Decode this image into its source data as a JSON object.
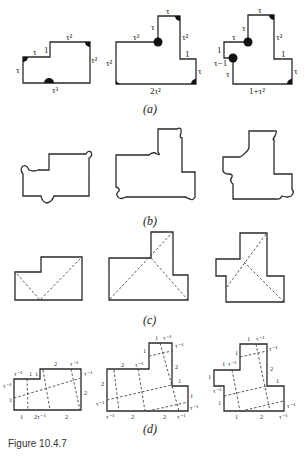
{
  "caption": "Figure 10.4.7",
  "panels": {
    "a": {
      "label": "(a)",
      "shapes": [
        {
          "edges": [
            "τ",
            "τ",
            "1",
            "τ²",
            "τ²",
            "τ³"
          ]
        },
        {
          "edges": [
            "τ²",
            "τ²",
            "τ",
            "τ",
            "τ²",
            "1",
            "τ",
            "2τ²"
          ]
        },
        {
          "edges": [
            "1",
            "τ",
            "τ",
            "τ",
            "τ²",
            "1",
            "τ",
            "1+τ²",
            "τ",
            "τ−1"
          ]
        }
      ]
    },
    "b": {
      "label": "(b)"
    },
    "c": {
      "label": "(c)"
    },
    "d": {
      "label": "(d)",
      "shapes": [
        {
          "labels": [
            "2",
            "τ⁻¹",
            "τ⁻¹",
            "τ⁻¹",
            "1",
            "1",
            "τ⁻¹",
            "1",
            "2",
            "1",
            "2τ⁻¹",
            "2"
          ]
        },
        {
          "labels": [
            "1",
            "τ⁻¹",
            "τ⁻¹",
            "1",
            "2",
            "τ⁻¹",
            "2",
            "1",
            "2",
            "τ⁻¹",
            "1",
            "τ⁻¹",
            "τ⁻¹",
            "2",
            "2",
            "τ⁻¹"
          ]
        },
        {
          "labels": [
            "1",
            "τ⁻¹",
            "τ⁻¹",
            "1",
            "1",
            "τ⁻¹",
            "2",
            "1",
            "τ⁻¹",
            "1",
            "1",
            "τ⁻¹",
            "1",
            "2",
            "τ⁻¹"
          ]
        }
      ]
    }
  }
}
